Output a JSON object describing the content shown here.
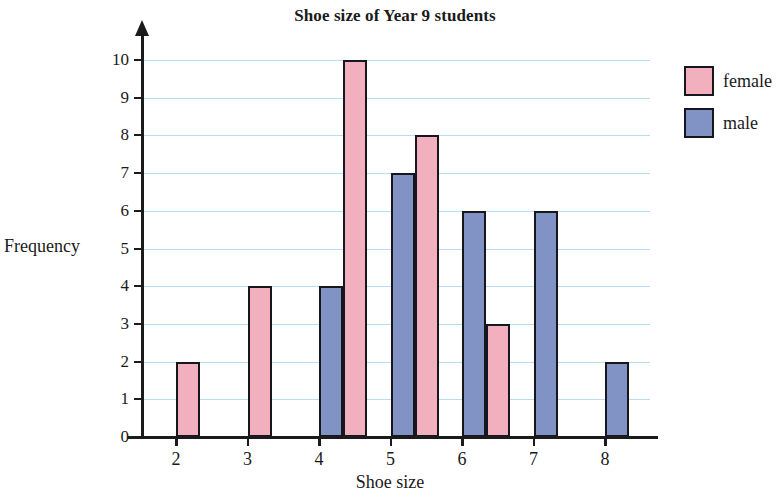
{
  "chart_data": {
    "type": "bar",
    "title": "Shoe size of Year 9 students",
    "xlabel": "Shoe size",
    "ylabel": "Frequency",
    "categories": [
      "2",
      "3",
      "4",
      "5",
      "6",
      "7",
      "8"
    ],
    "series": [
      {
        "name": "male",
        "color": "#8093c4",
        "values": [
          0,
          0,
          4,
          7,
          6,
          6,
          2
        ]
      },
      {
        "name": "female",
        "color": "#f2afbd",
        "values": [
          2,
          4,
          10,
          8,
          3,
          0,
          0
        ]
      }
    ],
    "series_draw_order": [
      "male",
      "female"
    ],
    "ylim": [
      0,
      10
    ],
    "y_ticks": [
      "0",
      "1",
      "2",
      "3",
      "4",
      "5",
      "6",
      "7",
      "8",
      "9",
      "10"
    ],
    "x_ticks": [
      "2",
      "3",
      "4",
      "5",
      "6",
      "7",
      "8"
    ],
    "grid": true,
    "grid_color": "#b9dcf2",
    "legend_position": "right",
    "bar_border_color": "#16161e"
  },
  "legend": {
    "items": [
      {
        "label": "female",
        "color": "#f2afbd"
      },
      {
        "label": "male",
        "color": "#8093c4"
      }
    ]
  }
}
